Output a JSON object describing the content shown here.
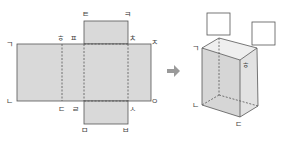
{
  "net": {
    "labels": {
      "g": "ㄱ",
      "n": "ㄴ",
      "d": "ㄷ",
      "r": "ㄹ",
      "m": "ㅁ",
      "b": "ㅂ",
      "s": "ㅅ",
      "o": "ㅇ",
      "j": "ㅈ",
      "ch": "ㅊ",
      "k": "ㅋ",
      "t": "ㅌ",
      "p": "ㅍ",
      "h": "ㅎ"
    },
    "fill_color": "#d9d9d9",
    "stroke_color": "#555555"
  },
  "arrow": {
    "color": "#9a9a9a"
  },
  "box": {
    "labels": {
      "g": "ㄱ",
      "n": "ㄴ",
      "d": "ㄷ",
      "h": "ㅎ"
    },
    "answer_boxes": [
      "",
      ""
    ]
  }
}
